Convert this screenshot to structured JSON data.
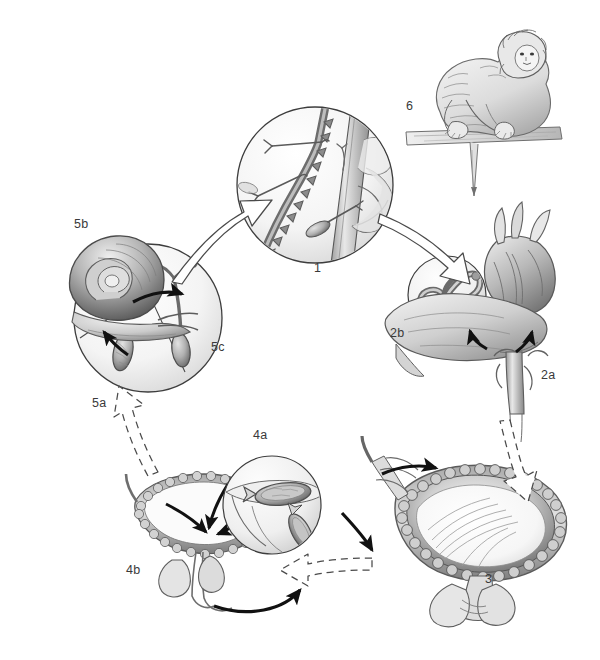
{
  "figure": {
    "style": "grayscale pen-and-ink medical illustration",
    "background_color": "#ffffff",
    "ink_color": "#3a3a3a",
    "arrow_fill": "#ffffff",
    "arrow_stroke": "#4a4a4a",
    "solid_arrow_color": "#1a1a1a"
  },
  "stages": [
    {
      "id": "stage-1",
      "label": "1",
      "name": "cercariae-penetrating-skin",
      "label_x": 314,
      "label_y": 261,
      "circle": {
        "cx": 315,
        "cy": 185,
        "r": 78
      },
      "description": "Fork-tailed cercariae penetrating skin and entering a blood vessel"
    },
    {
      "id": "stage-2b",
      "label": "2b",
      "name": "adult-worm-pair-in-vessel",
      "label_x": 390,
      "label_y": 326,
      "circle": {
        "cx": 447,
        "cy": 295,
        "r": 39
      },
      "description": "Paired adult male and female worms inside a vessel"
    },
    {
      "id": "stage-2a",
      "label": "2a",
      "name": "heart-liver-portal-circulation",
      "label_x": 541,
      "label_y": 368,
      "description": "Schistosomula migrate through heart and liver via portal circulation"
    },
    {
      "id": "stage-3",
      "label": "3",
      "name": "bladder-venous-plexus",
      "label_x": 485,
      "label_y": 572,
      "description": "Adult worms in the vesical venous plexus of the bladder"
    },
    {
      "id": "stage-4a",
      "label": "4a",
      "name": "eggs-detail-inset",
      "label_x": 253,
      "label_y": 428,
      "circle": {
        "cx": 272,
        "cy": 505,
        "r": 49
      },
      "description": "Detail of terminal-spined eggs passing through the bladder wall"
    },
    {
      "id": "stage-4b",
      "label": "4b",
      "name": "eggs-shed-from-bladder",
      "label_x": 126,
      "label_y": 563,
      "description": "Eggs excreted from the bladder with urine"
    },
    {
      "id": "stage-5a",
      "label": "5a",
      "name": "miracidium-hatching",
      "label_x": 92,
      "label_y": 396,
      "circle": {
        "cx": 148,
        "cy": 318,
        "r": 74
      },
      "description": "Egg hatches releasing a free-swimming miracidium"
    },
    {
      "id": "stage-5b",
      "label": "5b",
      "name": "snail-intermediate-host",
      "label_x": 74,
      "label_y": 217,
      "description": "Miracidium infects the freshwater snail intermediate host"
    },
    {
      "id": "stage-5c",
      "label": "5c",
      "name": "cercaria-released-from-snail",
      "label_x": 211,
      "label_y": 340,
      "description": "Fork-tailed cercaria released from the snail into water"
    },
    {
      "id": "stage-6",
      "label": "6",
      "name": "primate-definitive-host",
      "label_x": 406,
      "label_y": 99,
      "description": "Monkey, the definitive host, crouching on a branch"
    }
  ],
  "arrows": [
    {
      "name": "arrow-snail-circle-to-stage-1",
      "style": "outline",
      "from": "stage-5c",
      "to": "stage-1"
    },
    {
      "name": "arrow-stage-1-to-stage-2",
      "style": "outline",
      "from": "stage-1",
      "to": "stage-2a"
    },
    {
      "name": "arrow-stage-2-to-stage-3",
      "style": "outline-dashed",
      "from": "stage-2a",
      "to": "stage-3"
    },
    {
      "name": "arrow-stage-3-to-stage-4b",
      "style": "outline-dashed",
      "from": "stage-3",
      "to": "stage-4b"
    },
    {
      "name": "arrow-stage-4b-to-stage-5a",
      "style": "outline-dashed",
      "from": "stage-4b",
      "to": "stage-5a"
    },
    {
      "name": "arrow-eggs-into-bladder-lumen",
      "style": "solid"
    },
    {
      "name": "arrow-eggs-to-urethra",
      "style": "solid"
    },
    {
      "name": "arrow-worms-into-bladder-plexus",
      "style": "solid"
    },
    {
      "name": "arrow-worms-along-vessel",
      "style": "solid"
    },
    {
      "name": "arrow-miracidium-to-snail",
      "style": "solid"
    },
    {
      "name": "arrow-snail-to-cercaria",
      "style": "solid"
    },
    {
      "name": "arrow-liver-left",
      "style": "solid"
    },
    {
      "name": "arrow-liver-right",
      "style": "solid"
    }
  ]
}
